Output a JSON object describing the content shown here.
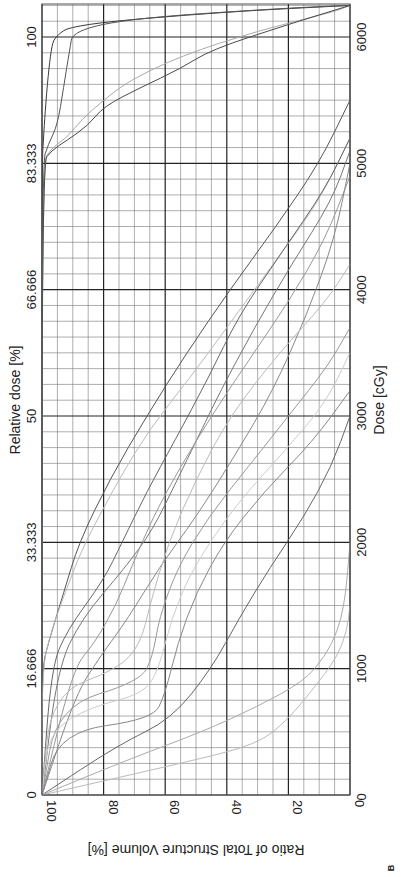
{
  "chart_data": {
    "type": "line",
    "title": "",
    "panel_label": "B",
    "orientation": "rotated 90 degrees clockwise (dose axis vertical, volume axis horizontal)",
    "xlabel": "Dose [cGy]",
    "ylabel": "Ratio of Total Structure Volume [%]",
    "secondary_xlabel": "Relative dose [%]",
    "xlim": [
      0,
      6250
    ],
    "ylim": [
      0,
      100
    ],
    "grid": true,
    "legend": "none",
    "x_ticks": [
      "0",
      "1000",
      "2000",
      "3000",
      "4000",
      "5000",
      "6000"
    ],
    "x_tick_values": [
      0,
      1000,
      2000,
      3000,
      4000,
      5000,
      6000
    ],
    "secondary_x_ticks": [
      "0",
      "16.666",
      "33.333",
      "50",
      "66.666",
      "83.333",
      "100"
    ],
    "y_ticks": [
      "0",
      "20",
      "40",
      "60",
      "80",
      "100"
    ],
    "y_tick_values": [
      0,
      20,
      40,
      60,
      80,
      100
    ],
    "series": [
      {
        "name": "PTV (dark)",
        "color": "#3a3a3a",
        "x": [
          0,
          5000,
          5200,
          5400,
          5700,
          5900,
          6000,
          6100,
          6200,
          6250
        ],
        "y": [
          100,
          100,
          99.5,
          99,
          98,
          97,
          96,
          90,
          40,
          0
        ]
      },
      {
        "name": "PTV (dark 2)",
        "color": "#555555",
        "x": [
          0,
          5000,
          5150,
          5300,
          5600,
          5900,
          6050,
          6150,
          6230,
          6250
        ],
        "y": [
          100,
          100,
          98,
          95,
          93,
          91,
          90,
          70,
          20,
          0
        ]
      },
      {
        "name": "CTV (light)",
        "color": "#aaaaaa",
        "x": [
          0,
          5000,
          5120,
          5200,
          5350,
          5500,
          5650,
          5850,
          6050,
          6200,
          6250
        ],
        "y": [
          100,
          100,
          97,
          92,
          87,
          80,
          72,
          55,
          30,
          5,
          0
        ]
      },
      {
        "name": "GTV (medium)",
        "color": "#4a4a4a",
        "x": [
          0,
          5000,
          5100,
          5180,
          5300,
          5450,
          5600,
          5750,
          5900,
          6100,
          6250
        ],
        "y": [
          100,
          100,
          97,
          92,
          85,
          80,
          68,
          55,
          45,
          20,
          0
        ]
      },
      {
        "name": "OAR 1",
        "color": "#555555",
        "x": [
          0,
          1000,
          1200,
          1600,
          2000,
          2500,
          3000,
          3500,
          4000,
          4500,
          5000,
          5500
        ],
        "y": [
          100,
          100,
          98,
          93,
          88,
          78,
          66,
          53,
          39,
          24,
          10,
          0
        ]
      },
      {
        "name": "OAR 2",
        "color": "#bbbbbb",
        "x": [
          0,
          1000,
          1300,
          1700,
          2000,
          2500,
          2900,
          3300,
          3700,
          4200,
          4700,
          5200
        ],
        "y": [
          100,
          100,
          97,
          91,
          86,
          75,
          65,
          52,
          40,
          25,
          10,
          0
        ]
      },
      {
        "name": "OAR 3",
        "color": "#666666",
        "x": [
          0,
          1000,
          1300,
          1700,
          2000,
          2400,
          2800,
          3300,
          3800,
          4300,
          4800,
          5200
        ],
        "y": [
          100,
          97,
          92,
          80,
          74,
          66,
          57,
          46,
          36,
          22,
          8,
          0
        ]
      },
      {
        "name": "OAR 4",
        "color": "#777777",
        "x": [
          0,
          1000,
          1400,
          1800,
          2100,
          2500,
          2800,
          3200,
          3700,
          4200,
          4700,
          5100
        ],
        "y": [
          100,
          95,
          87,
          73,
          64,
          56,
          50,
          42,
          31,
          19,
          6,
          0
        ]
      },
      {
        "name": "OAR 5",
        "color": "#999999",
        "x": [
          0,
          1000,
          1200,
          1500,
          1800,
          2200,
          2600,
          3000,
          3400,
          3900,
          4400,
          4900
        ],
        "y": [
          100,
          90,
          83,
          76,
          71,
          64,
          55,
          45,
          34,
          20,
          8,
          0
        ]
      },
      {
        "name": "OAR 6",
        "color": "#888888",
        "x": [
          0,
          800,
          1100,
          1400,
          1800,
          2200,
          2700,
          3200,
          3800,
          4400,
          5000
        ],
        "y": [
          100,
          89,
          81,
          72,
          62,
          50,
          37,
          25,
          14,
          5,
          0
        ]
      },
      {
        "name": "OAR 7",
        "color": "#bbbbbb",
        "x": [
          0,
          800,
          1000,
          1200,
          1500,
          2000,
          2500,
          3000,
          3500,
          3900,
          4200
        ],
        "y": [
          100,
          97,
          75,
          68,
          65,
          59,
          50,
          39,
          23,
          8,
          0
        ]
      },
      {
        "name": "OAR 8",
        "color": "#999999",
        "x": [
          0,
          700,
          900,
          1100,
          1400,
          1800,
          2200,
          2600,
          3000,
          3400,
          3700
        ],
        "y": [
          100,
          95,
          68,
          64,
          62,
          56,
          46,
          33,
          20,
          7,
          0
        ]
      },
      {
        "name": "OAR 9",
        "color": "#cccccc",
        "x": [
          0,
          500,
          700,
          800,
          1000,
          1400,
          1800,
          2300,
          2700,
          3100,
          3500
        ],
        "y": [
          100,
          98,
          84,
          67,
          62,
          58,
          51,
          37,
          22,
          8,
          0
        ]
      },
      {
        "name": "OAR 10",
        "color": "#888888",
        "x": [
          0,
          500,
          600,
          800,
          1200,
          1600,
          2000,
          2400,
          2800,
          3200
        ],
        "y": [
          100,
          94,
          64,
          60,
          56,
          50,
          41,
          28,
          12,
          0
        ]
      },
      {
        "name": "OAR 11",
        "color": "#666666",
        "x": [
          0,
          400,
          600,
          1000,
          1400,
          1800,
          2200,
          2600,
          3000
        ],
        "y": [
          100,
          75,
          58,
          45,
          36,
          26,
          15,
          6,
          0
        ]
      },
      {
        "name": "OAR 12",
        "color": "#aaaaaa",
        "x": [
          0,
          300,
          500,
          700,
          900,
          1100,
          1300,
          1500,
          1700,
          2000
        ],
        "y": [
          100,
          70,
          48,
          30,
          15,
          8,
          4,
          2,
          1,
          0
        ]
      },
      {
        "name": "OAR 13",
        "color": "#bbbbbb",
        "x": [
          0,
          250,
          400,
          600,
          900,
          1100,
          1300,
          1500
        ],
        "y": [
          100,
          55,
          30,
          20,
          10,
          4,
          1,
          0
        ]
      }
    ]
  }
}
